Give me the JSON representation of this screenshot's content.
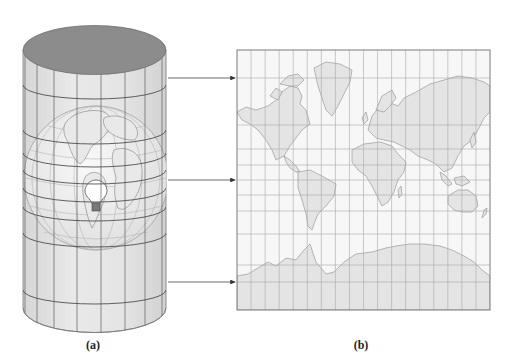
{
  "figure": {
    "panels": [
      {
        "id": "a",
        "caption": "(a)",
        "description": "Cylinder wrapped around a transparent globe with a light bulb at its center",
        "cylinder": {
          "cx": 94.5,
          "top_y": 50,
          "bottom_y": 308,
          "rx": 71.5,
          "ry": 24.5,
          "meridian_x": [
            25,
            37,
            54,
            77,
            101,
            125,
            145,
            162
          ],
          "ring_edge_y": [
            85,
            130,
            153,
            170,
            188,
            207,
            233,
            290
          ]
        },
        "globe": {
          "cx": 96,
          "cy": 178,
          "r": 72
        },
        "light_bulb": {
          "cx": 96,
          "cy": 196
        }
      },
      {
        "id": "b",
        "caption": "(b)",
        "description": "Resulting cylindrical (Mercator-style) world map with graticule",
        "map": {
          "x": 237,
          "y": 50,
          "width": 253,
          "height": 260,
          "columns": 18,
          "parallel_y": [
            78,
            125,
            149,
            165,
            180,
            195,
            211,
            234,
            265,
            282
          ]
        }
      }
    ],
    "arrows": [
      {
        "from_x": 168,
        "to_x": 236,
        "y": 78
      },
      {
        "from_x": 168,
        "to_x": 236,
        "y": 180
      },
      {
        "from_x": 168,
        "to_x": 236,
        "y": 282
      }
    ]
  },
  "colors": {
    "background": "#ffffff",
    "cylinder_cap": "#8c8c8c",
    "cylinder_body": "#e3e3e3",
    "grid_line": "#6a6a6a",
    "map_background": "#f7f7f7",
    "map_land": "#e4e4e4",
    "map_coast": "#9a9a9a",
    "map_grid": "#a8a8a8",
    "arrow": "#333333",
    "globe_fill": "#f0f0f0"
  }
}
